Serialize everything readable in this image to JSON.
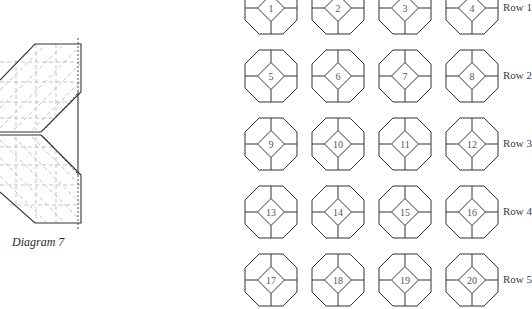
{
  "left_diagram": {
    "caption": "Diagram 7",
    "stroke_color": "#333333",
    "guide_color": "#aaaaaa"
  },
  "grid": {
    "columns": 4,
    "rows": [
      {
        "label": "Row 1",
        "blocks": [
          "1",
          "2",
          "3",
          "4"
        ]
      },
      {
        "label": "Row 2",
        "blocks": [
          "5",
          "6",
          "7",
          "8"
        ]
      },
      {
        "label": "Row 3",
        "blocks": [
          "9",
          "10",
          "11",
          "12"
        ]
      },
      {
        "label": "Row 4",
        "blocks": [
          "13",
          "14",
          "15",
          "16"
        ]
      },
      {
        "label": "Row 5",
        "blocks": [
          "17",
          "18",
          "19",
          "20"
        ]
      }
    ],
    "stroke_color": "#333333"
  }
}
